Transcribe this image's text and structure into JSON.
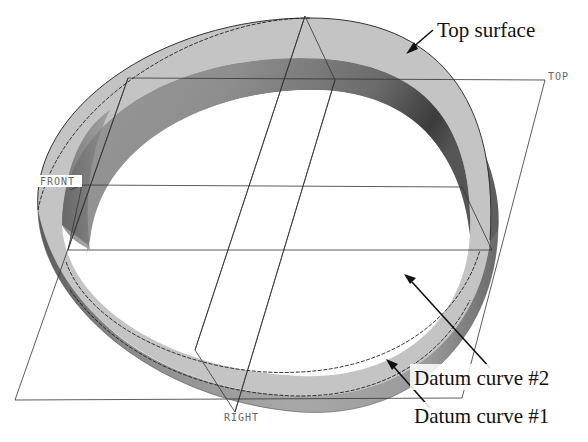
{
  "figure": {
    "type": "CAD model view"
  },
  "datum_planes": {
    "top": "TOP",
    "front": "FRONT",
    "right": "RIGHT"
  },
  "annotations": {
    "top_surface": "Top surface",
    "datum_curve_2": "Datum curve #2",
    "datum_curve_1": "Datum curve #1"
  },
  "colors": {
    "background": "#ffffff",
    "outer_wall": "#9a9a9a",
    "outer_wall_dark": "#5a5a5a",
    "top_surface": "#c4c4c4",
    "inner_wall": "#8c8c8c",
    "inner_wall_dark": "#3c3c3c",
    "lines": "#222222"
  }
}
